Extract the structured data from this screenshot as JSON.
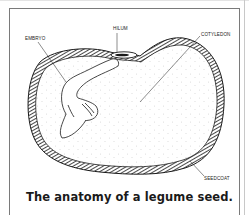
{
  "figure": {
    "caption": "The anatomy of a legume seed.",
    "labels": {
      "hilum": "HILUM",
      "embryo": "EMBRYO",
      "cotyledon": "COTYLEDON",
      "seedcoat": "SEEDCOAT"
    },
    "colors": {
      "line": "#1a1a1a",
      "frame": "#7a7a7a",
      "stipple": "#555555",
      "background": "#ffffff"
    }
  }
}
